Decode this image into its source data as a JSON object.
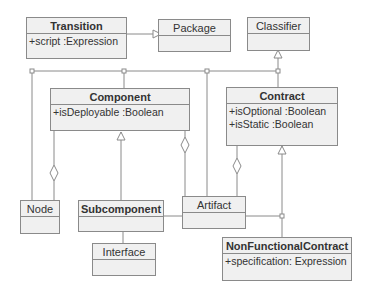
{
  "diagram": {
    "type": "UML class diagram",
    "classes": {
      "transition": {
        "name": "Transition",
        "attributes": [
          "+script :Expression"
        ]
      },
      "package": {
        "name": "Package"
      },
      "classifier": {
        "name": "Classifier"
      },
      "component": {
        "name": "Component",
        "attributes": [
          "+isDeployable :Boolean"
        ]
      },
      "contract": {
        "name": "Contract",
        "attributes": [
          "+isOptional :Boolean",
          "+isStatic :Boolean"
        ]
      },
      "node": {
        "name": "Node"
      },
      "subcomponent": {
        "name": "Subcomponent"
      },
      "artifact": {
        "name": "Artifact"
      },
      "interface": {
        "name": "Interface"
      },
      "nonfunctional": {
        "name": "NonFunctionalContract",
        "attributes": [
          "+specification: Expression"
        ]
      }
    },
    "relations": [
      {
        "from": "Transition",
        "to": "Package",
        "kind": "generalization"
      },
      {
        "from": "Component",
        "to": "Classifier",
        "kind": "generalization"
      },
      {
        "from": "Node",
        "to": "Classifier",
        "kind": "generalization"
      },
      {
        "from": "Artifact",
        "to": "Classifier",
        "kind": "generalization"
      },
      {
        "from": "Contract",
        "to": "Classifier",
        "kind": "generalization"
      },
      {
        "from": "Subcomponent",
        "to": "Component",
        "kind": "generalization"
      },
      {
        "from": "Node",
        "to": "Component",
        "kind": "aggregation"
      },
      {
        "from": "Artifact",
        "to": "Component",
        "kind": "aggregation"
      },
      {
        "from": "Artifact",
        "to": "Contract",
        "kind": "aggregation"
      },
      {
        "from": "Interface",
        "to": "Contract",
        "kind": "generalization"
      },
      {
        "from": "NonFunctionalContract",
        "to": "Contract",
        "kind": "generalization"
      }
    ]
  },
  "colors": {
    "box_fill": "#f0f0f0",
    "line": "#8a8a8a",
    "text": "#333333"
  }
}
